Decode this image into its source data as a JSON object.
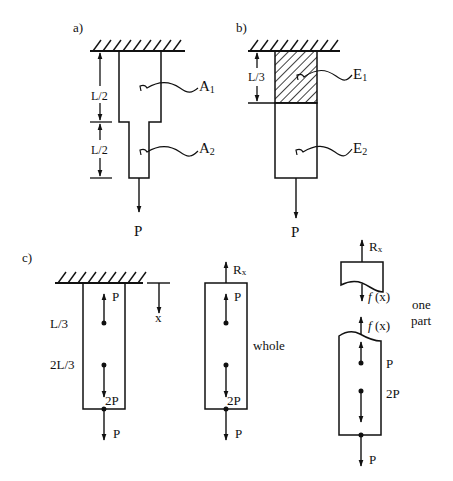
{
  "figure": {
    "panel_a": {
      "label": "a)",
      "segment_lengths": [
        "L/2",
        "L/2"
      ],
      "areas": [
        "A",
        "A"
      ],
      "area_subscripts": [
        "1",
        "2"
      ],
      "load": "P"
    },
    "panel_b": {
      "label": "b)",
      "segment_length": "L/3",
      "moduli": [
        "E",
        "E"
      ],
      "modulus_subscripts": [
        "1",
        "2"
      ],
      "load": "P"
    },
    "panel_c": {
      "label": "c)",
      "positions": [
        "L/3",
        "2L/3"
      ],
      "axis_label": "x",
      "fixed_bar": {
        "loads": [
          "P",
          "2P",
          "P"
        ]
      },
      "whole": {
        "caption": "whole",
        "reaction": "R",
        "reaction_subscript": "x",
        "loads": [
          "P",
          "2P",
          "P"
        ]
      },
      "one_part": {
        "caption_line1": "one",
        "caption_line2": "part",
        "reaction": "R",
        "reaction_subscript": "x",
        "internal_force_fn": "f",
        "internal_force_arg": " (x)",
        "loads": [
          "P",
          "2P",
          "P"
        ]
      }
    }
  },
  "colors": {
    "ink": "#111111",
    "background": "#ffffff"
  }
}
